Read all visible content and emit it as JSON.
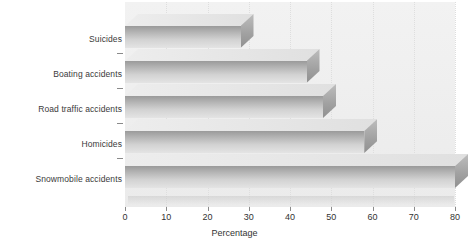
{
  "chart_data": {
    "type": "bar",
    "orientation": "horizontal",
    "style": "3d",
    "title": "",
    "xlabel": "Percentage",
    "ylabel": "",
    "categories": [
      "Suicides",
      "Boating accidents",
      "Road traffic accidents",
      "Homicides",
      "Snowmobile accidents"
    ],
    "values": [
      28,
      44,
      48,
      58,
      80
    ],
    "xlim": [
      0,
      80
    ],
    "xticks": [
      0,
      10,
      20,
      30,
      40,
      50,
      60,
      70,
      80
    ],
    "xtick_labels": [
      "0",
      "10",
      "20",
      "30",
      "40",
      "50",
      "60",
      "70",
      "80"
    ],
    "grid": true,
    "grid_axis": "x",
    "grid_style": "dotted",
    "legend": false,
    "colors": {
      "bar_front_dark": "#9a9a9a",
      "bar_front_light": "#e4e4e4",
      "bar_top": "#e8e8e8",
      "bar_side": "#a0a0a0",
      "panel_background": "#eeeeee",
      "gridline": "#dedede",
      "axis": "#8a8a8a",
      "text": "#333333"
    }
  },
  "axis": {
    "x_title": "Percentage"
  }
}
